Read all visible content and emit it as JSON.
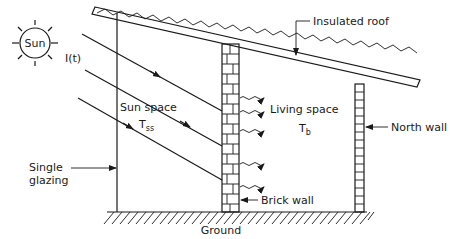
{
  "diagram": {
    "type": "passive solar sunspace cross-section",
    "labels": {
      "sun": "Sun",
      "irradiance": "I(t)",
      "sun_space": "Sun space",
      "sun_space_temp_main": "T",
      "sun_space_temp_sub": "ss",
      "living_space": "Living space",
      "living_space_temp_main": "T",
      "living_space_temp_sub": "b",
      "roof": "Insulated roof",
      "north_wall": "North wall",
      "glazing_line1": "Single",
      "glazing_line2": "glazing",
      "brick_wall": "Brick wall",
      "ground": "Ground"
    },
    "colors": {
      "ink": "#1a1a1a",
      "background": "#ffffff"
    }
  }
}
